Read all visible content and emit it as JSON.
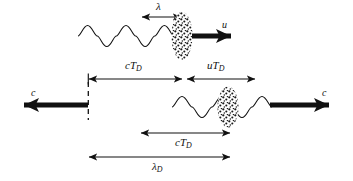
{
  "figure": {
    "background_color": "#ffffff",
    "stroke_color": "#111111",
    "width": 353,
    "height": 181
  },
  "labels": {
    "lambda": "λ",
    "u": "u",
    "cTd_top": "cT",
    "cTd_top_sub": "D",
    "uTd": "uT",
    "uTd_sub": "D",
    "c_left": "c",
    "c_right": "c",
    "cTd_bottom": "cT",
    "cTd_bottom_sub": "D",
    "lambdaD": "λ",
    "lambdaD_sub": "D"
  },
  "elements": {
    "top_wave": {
      "name": "incident-wave-top",
      "x_start": 78,
      "x_end": 174,
      "baseline_y": 36,
      "amplitude": 17,
      "cycles": 2.5
    },
    "top_blob": {
      "name": "emitter-blob-top",
      "cx": 182,
      "cy": 36,
      "rx": 10,
      "ry": 24
    },
    "bottom_wave": {
      "name": "emitted-wave-bottom",
      "x_start": 172,
      "x_end": 276,
      "baseline_y": 107,
      "amplitude": 17,
      "cycles": 2.5
    },
    "bottom_blob": {
      "name": "emitter-blob-bottom",
      "cx": 228,
      "cy": 107,
      "rx": 10,
      "ry": 20
    },
    "lambda_arrow": {
      "x1": 141,
      "x2": 182,
      "y": 17
    },
    "u_arrow": {
      "x1": 192,
      "x2": 243,
      "y": 36
    },
    "cTd_top_arrow": {
      "x1": 88,
      "x2": 183,
      "y": 79
    },
    "uTd_arrow": {
      "x1": 186,
      "x2": 256,
      "y": 79
    },
    "dashed_line": {
      "x": 88,
      "y1": 80,
      "y2": 120
    },
    "c_left_arrow": {
      "x1": 88,
      "x2": 11,
      "y": 105
    },
    "c_right_arrow": {
      "x1": 271,
      "x2": 341,
      "y": 105
    },
    "cTd_bottom_arrow": {
      "x1": 140,
      "x2": 231,
      "y": 133
    },
    "lambdaD_arrow": {
      "x1": 88,
      "x2": 231,
      "y": 157
    }
  },
  "label_positions": {
    "lambda": {
      "x": 156,
      "y": 2
    },
    "u": {
      "x": 222,
      "y": 21
    },
    "cTd_top": {
      "x": 126,
      "y": 62
    },
    "uTd": {
      "x": 208,
      "y": 62
    },
    "c_left": {
      "x": 31,
      "y": 89
    },
    "c_right": {
      "x": 323,
      "y": 89
    },
    "cTd_bottom": {
      "x": 176,
      "y": 138
    },
    "lambdaD": {
      "x": 153,
      "y": 162
    }
  }
}
